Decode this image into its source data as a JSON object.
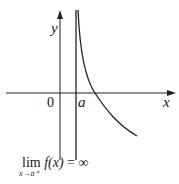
{
  "figure": {
    "axes": {
      "x_label": "x",
      "y_label": "y",
      "origin_label": "0",
      "asymptote_label": "a"
    },
    "formula": {
      "lim": "lim",
      "subscript": "x→a⁺",
      "function": "f(x)",
      "equals": "=",
      "value": "∞"
    },
    "colors": {
      "stroke": "#222222",
      "background": "#ffffff"
    }
  }
}
